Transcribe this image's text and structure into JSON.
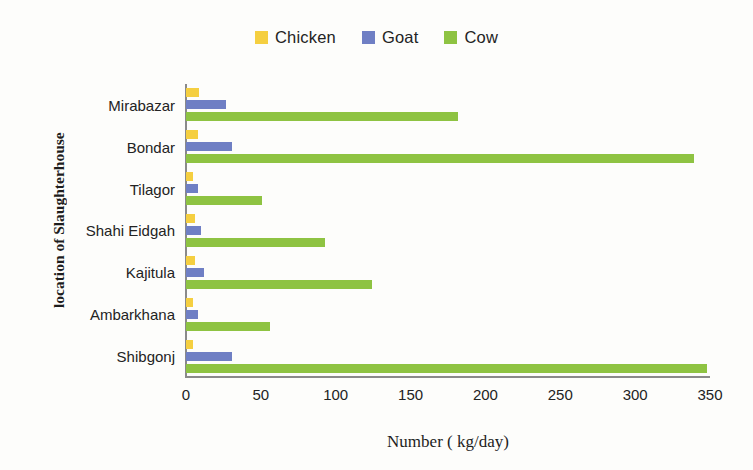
{
  "chart_data": {
    "type": "bar",
    "orientation": "horizontal",
    "title": "",
    "xlabel": "Number ( kg/day)",
    "ylabel": "location of Slaughterhouse",
    "categories": [
      "Mirabazar",
      "Bondar",
      "Tilagor",
      "Shahi Eidgah",
      "Kajitula",
      "Ambarkhana",
      "Shibgonj"
    ],
    "series": [
      {
        "name": "Chicken",
        "color": "#f5cf40",
        "values": [
          9,
          8,
          5,
          6,
          6,
          5,
          5
        ]
      },
      {
        "name": "Goat",
        "color": "#6f7fc4",
        "values": [
          27,
          31,
          8,
          10,
          12,
          8,
          31
        ]
      },
      {
        "name": "Cow",
        "color": "#8ec342",
        "values": [
          182,
          339,
          51,
          93,
          124,
          56,
          348
        ]
      }
    ],
    "xlim": [
      0,
      350
    ],
    "xticks": [
      0,
      50,
      100,
      150,
      200,
      250,
      300,
      350
    ],
    "xtick_labels": [
      "0",
      "50",
      "100",
      "150",
      "200",
      "250",
      "300",
      "350"
    ],
    "grid": false,
    "legend_position": "top-center"
  }
}
